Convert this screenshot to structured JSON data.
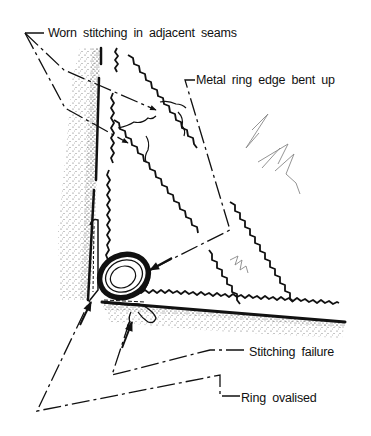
{
  "diagram": {
    "colors": {
      "ink": "#111111",
      "stipple": "#333333",
      "sketch": "#777777",
      "background": "#ffffff"
    },
    "labels": [
      {
        "id": "worn-stitching",
        "text": "Worn stitching in adjacent seams",
        "x": 48,
        "y": 26
      },
      {
        "id": "metal-ring-edge",
        "text": "Metal ring  edge  bent  up",
        "x": 196,
        "y": 73
      },
      {
        "id": "stitching-failure",
        "text": "Stitching  failure",
        "x": 249,
        "y": 345
      },
      {
        "id": "ring-ovalised",
        "text": "Ring  ovalised",
        "x": 241,
        "y": 391
      }
    ]
  }
}
